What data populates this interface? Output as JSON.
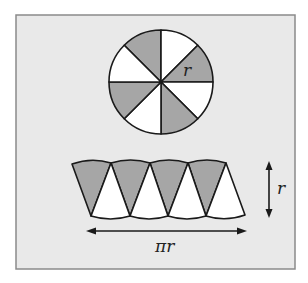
{
  "figure": {
    "colors": {
      "panel_bg": "#e9e9e9",
      "panel_border": "#8a8a8a",
      "sector_gray": "#a6a6a6",
      "sector_white": "#ffffff",
      "stroke": "#1a1a1a"
    },
    "circle": {
      "sector_count": 8,
      "radius_label": "r"
    },
    "strip": {
      "width_label": "πr",
      "height_label": "r"
    }
  }
}
